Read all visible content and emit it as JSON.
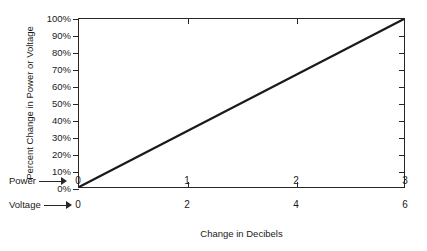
{
  "chart_data": {
    "type": "line",
    "title": "",
    "xlabel": "Change in Decibels",
    "ylabel": "Percent Change in Power or Voltage",
    "xlim": [
      0,
      3
    ],
    "ylim": [
      0,
      100
    ],
    "grid": false,
    "legend": "none",
    "series": [
      {
        "name": "Percent change",
        "x": [
          0,
          3
        ],
        "y": [
          0,
          100
        ],
        "color": "#1a1a1a"
      }
    ],
    "y_tick_labels": [
      "0%",
      "10%",
      "20%",
      "30%",
      "40%",
      "50%",
      "60%",
      "70%",
      "80%",
      "90%",
      "100%"
    ],
    "y_tick_values": [
      0,
      10,
      20,
      30,
      40,
      50,
      60,
      70,
      80,
      90,
      100
    ],
    "x_scales": [
      {
        "caption": "Power",
        "arrow_icon": "right-arrow-icon",
        "tick_labels": [
          "0",
          "1",
          "2",
          "3"
        ],
        "tick_values": [
          0,
          1,
          2,
          3
        ]
      },
      {
        "caption": "Voltage",
        "arrow_icon": "right-arrow-icon",
        "tick_labels": [
          "0",
          "2",
          "4",
          "6"
        ],
        "tick_values": [
          0,
          1,
          2,
          3
        ]
      }
    ],
    "top_axis_tick_values": [
      1,
      2
    ],
    "right_axis_tick_values": [
      10,
      20,
      30,
      40,
      50,
      60,
      70,
      80,
      90
    ],
    "frame_color": "#262626",
    "background_color": "#ffffff"
  }
}
